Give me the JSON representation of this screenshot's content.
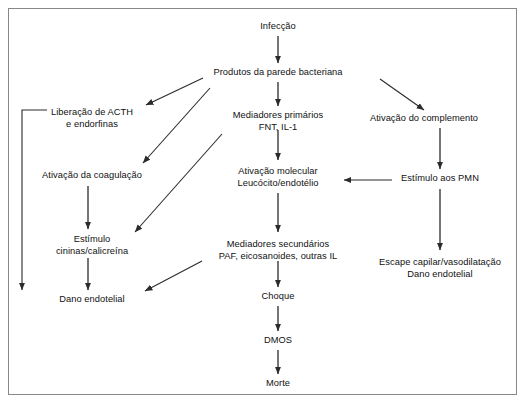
{
  "diagram": {
    "title_text": "",
    "border_color": "#888888",
    "line_color": "#2b2b2b",
    "text_color": "#111111",
    "background": "#ffffff",
    "nodes": [
      {
        "id": "infeccao",
        "line1": "Infecção",
        "line2": "",
        "cx": 278,
        "cy": 27
      },
      {
        "id": "produtos",
        "line1": "Produtos da parede bacteriana",
        "line2": "",
        "cx": 278,
        "cy": 73
      },
      {
        "id": "acth",
        "line1": "Liberação de ACTH",
        "line2": "e endorfinas",
        "cx": 92,
        "cy": 113
      },
      {
        "id": "mediadores-prim",
        "line1": "Mediadores primários",
        "line2": "FNT, IL-1",
        "cx": 278,
        "cy": 116
      },
      {
        "id": "complemento",
        "line1": "Ativação do complemento",
        "line2": "",
        "cx": 424,
        "cy": 119
      },
      {
        "id": "coagulacao",
        "line1": "Ativação da coagulação",
        "line2": "",
        "cx": 92,
        "cy": 176
      },
      {
        "id": "ativacao-mol",
        "line1": "Ativação molecular",
        "line2": "Leucócito/endotélio",
        "cx": 278,
        "cy": 172
      },
      {
        "id": "pmn",
        "line1": "Estímulo aos PMN",
        "line2": "",
        "cx": 440,
        "cy": 179
      },
      {
        "id": "cininas",
        "line1": "Estímulo",
        "line2": "cininas/calicreína",
        "cx": 92,
        "cy": 240
      },
      {
        "id": "mediadores-sec",
        "line1": "Mediadores secundários",
        "line2": "PAF, eicosanoides, outras IL",
        "cx": 278,
        "cy": 245
      },
      {
        "id": "escape",
        "line1": "Escape capilar/vasodilatação",
        "line2": "Dano endotelial",
        "cx": 440,
        "cy": 263
      },
      {
        "id": "dano-endotelial",
        "line1": "Dano endotelial",
        "line2": "",
        "cx": 92,
        "cy": 300
      },
      {
        "id": "choque",
        "line1": "Choque",
        "line2": "",
        "cx": 278,
        "cy": 297
      },
      {
        "id": "dmos",
        "line1": "DMOS",
        "line2": "",
        "cx": 278,
        "cy": 341
      },
      {
        "id": "morte",
        "line1": "Morte",
        "line2": "",
        "cx": 278,
        "cy": 384
      }
    ],
    "edges": [
      {
        "id": "infeccao-to-produtos",
        "from": "infeccao",
        "to": "produtos",
        "kind": "vertical"
      },
      {
        "id": "produtos-to-acth",
        "from": "produtos",
        "to": "acth",
        "kind": "diagonal"
      },
      {
        "id": "produtos-to-coagulacao",
        "from": "produtos",
        "to": "coagulacao",
        "kind": "diagonal"
      },
      {
        "id": "produtos-to-mediadores",
        "from": "produtos",
        "to": "mediadores-prim",
        "kind": "vertical"
      },
      {
        "id": "produtos-to-complemento",
        "from": "produtos",
        "to": "complemento",
        "kind": "diagonal"
      },
      {
        "id": "produtos-to-cininas",
        "from": "mediadores-prim",
        "to": "cininas",
        "kind": "diagonal"
      },
      {
        "id": "acth-to-bottom",
        "from": "acth",
        "to": "",
        "kind": "elbow"
      },
      {
        "id": "mediadores-to-ativacao",
        "from": "mediadores-prim",
        "to": "ativacao-mol",
        "kind": "vertical"
      },
      {
        "id": "complemento-to-pmn",
        "from": "complemento",
        "to": "pmn",
        "kind": "vertical"
      },
      {
        "id": "coagulacao-to-cininas",
        "from": "coagulacao",
        "to": "cininas",
        "kind": "vertical"
      },
      {
        "id": "pmn-to-ativacao",
        "from": "pmn",
        "to": "ativacao-mol",
        "kind": "horizontal"
      },
      {
        "id": "pmn-to-escape",
        "from": "pmn",
        "to": "escape",
        "kind": "vertical"
      },
      {
        "id": "ativacao-to-mediadores-sec",
        "from": "ativacao-mol",
        "to": "mediadores-sec",
        "kind": "vertical"
      },
      {
        "id": "cininas-to-dano",
        "from": "cininas",
        "to": "dano-endotelial",
        "kind": "vertical"
      },
      {
        "id": "mediadores-sec-to-dano",
        "from": "mediadores-sec",
        "to": "dano-endotelial",
        "kind": "diagonal"
      },
      {
        "id": "mediadores-sec-to-choque",
        "from": "mediadores-sec",
        "to": "choque",
        "kind": "vertical"
      },
      {
        "id": "choque-to-dmos",
        "from": "choque",
        "to": "dmos",
        "kind": "vertical"
      },
      {
        "id": "dmos-to-morte",
        "from": "dmos",
        "to": "morte",
        "kind": "vertical"
      }
    ]
  }
}
